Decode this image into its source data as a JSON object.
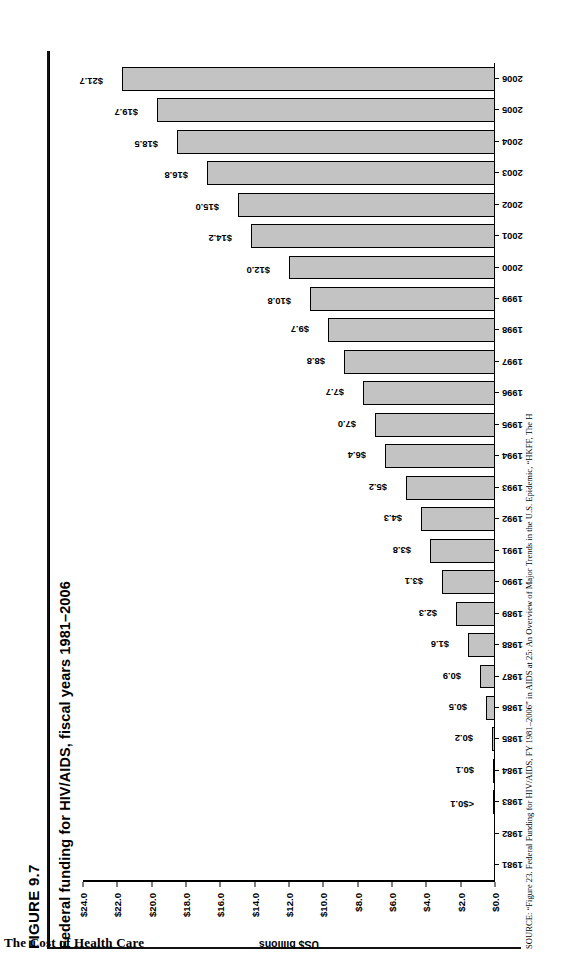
{
  "book": {
    "running_footer": "The Cost of Health Care"
  },
  "figure": {
    "number": "FIGURE 9.7",
    "title": "Federal funding for HIV/AIDS, fiscal years 1981–2006",
    "source": "SOURCE: “Figure 23. Federal Funding for HIV/AIDS, FY 1981–2006” in AIDS at 25: An Overview of Major Trends in the U.S. Epidemic, “HKFF, The H"
  },
  "chart_data": {
    "type": "bar",
    "title": "Federal funding for HIV/AIDS, fiscal years 1981–2006",
    "xlabel": "",
    "ylabel": "US$ billions",
    "ylim": [
      0.0,
      24.0
    ],
    "ytick_labels": [
      "$0.0",
      "$2.0",
      "$4.0",
      "$6.0",
      "$8.0",
      "$10.0",
      "$12.0",
      "$14.0",
      "$16.0",
      "$18.0",
      "$20.0",
      "$22.0",
      "$24.0"
    ],
    "ytick_values": [
      0,
      2,
      4,
      6,
      8,
      10,
      12,
      14,
      16,
      18,
      20,
      22,
      24
    ],
    "grid": false,
    "legend": "none",
    "bar_color": "#c3c3c3",
    "bar_edge_color": "#000000",
    "categories": [
      "1981",
      "1982",
      "1983",
      "1984",
      "1985",
      "1986",
      "1987",
      "1988",
      "1989",
      "1990",
      "1991",
      "1992",
      "1993",
      "1994",
      "1995",
      "1996",
      "1997",
      "1998",
      "1999",
      "2000",
      "2001",
      "2002",
      "2003",
      "2004",
      "2005",
      "2006"
    ],
    "values": [
      0,
      0,
      0.05,
      0.1,
      0.2,
      0.5,
      0.9,
      1.6,
      2.3,
      3.1,
      3.8,
      4.3,
      5.2,
      6.4,
      7.0,
      7.7,
      8.8,
      9.7,
      10.8,
      12.0,
      14.2,
      15.0,
      16.8,
      18.5,
      19.7,
      21.7
    ],
    "data_labels": [
      "",
      "",
      "<$0.1",
      "$0.1",
      "$0.2",
      "$0.5",
      "$0.9",
      "$1.6",
      "$2.3",
      "$3.1",
      "$3.8",
      "$4.3",
      "$5.2",
      "$6.4",
      "$7.0",
      "$7.7",
      "$8.8",
      "$9.7",
      "$10.8",
      "$12.0",
      "$14.2",
      "$15.0",
      "$16.8",
      "$18.5",
      "$19.7",
      "$21.7"
    ]
  }
}
